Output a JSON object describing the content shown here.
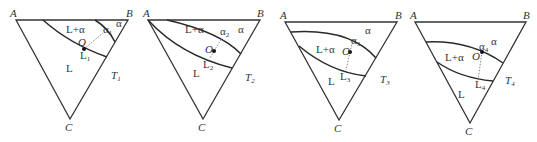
{
  "figure": {
    "panels": [
      {
        "id": "T1",
        "vertices": {
          "A": "A",
          "B": "B",
          "C": "C"
        },
        "regions": {
          "liquid": "L",
          "two_phase": "L+α",
          "solid": "α"
        },
        "point": "O",
        "liquid_end": "L",
        "liquid_end_sub": "1",
        "solid_end": "α",
        "solid_end_sub": "1",
        "temperature": "T",
        "temperature_sub": "1"
      },
      {
        "id": "T2",
        "vertices": {
          "A": "A",
          "B": "B",
          "C": "C"
        },
        "regions": {
          "liquid": "L",
          "two_phase": "L+α",
          "solid": "α"
        },
        "point": "O",
        "liquid_end": "L",
        "liquid_end_sub": "2",
        "solid_end": "α",
        "solid_end_sub": "2",
        "temperature": "T",
        "temperature_sub": "2"
      },
      {
        "id": "T3",
        "vertices": {
          "A": "A",
          "B": "B",
          "C": "C"
        },
        "regions": {
          "liquid": "L",
          "two_phase": "L+α",
          "solid": "α"
        },
        "point": "O",
        "liquid_end": "L",
        "liquid_end_sub": "3",
        "solid_end": "α",
        "solid_end_sub": "3",
        "temperature": "T",
        "temperature_sub": "3"
      },
      {
        "id": "T4",
        "vertices": {
          "A": "A",
          "B": "B",
          "C": "C"
        },
        "regions": {
          "liquid": "L",
          "two_phase": "L+α",
          "solid": "α"
        },
        "point": "O",
        "liquid_end": "L",
        "liquid_end_sub": "4",
        "solid_end": "α",
        "solid_end_sub": "4",
        "temperature": "T",
        "temperature_sub": "4"
      }
    ]
  }
}
